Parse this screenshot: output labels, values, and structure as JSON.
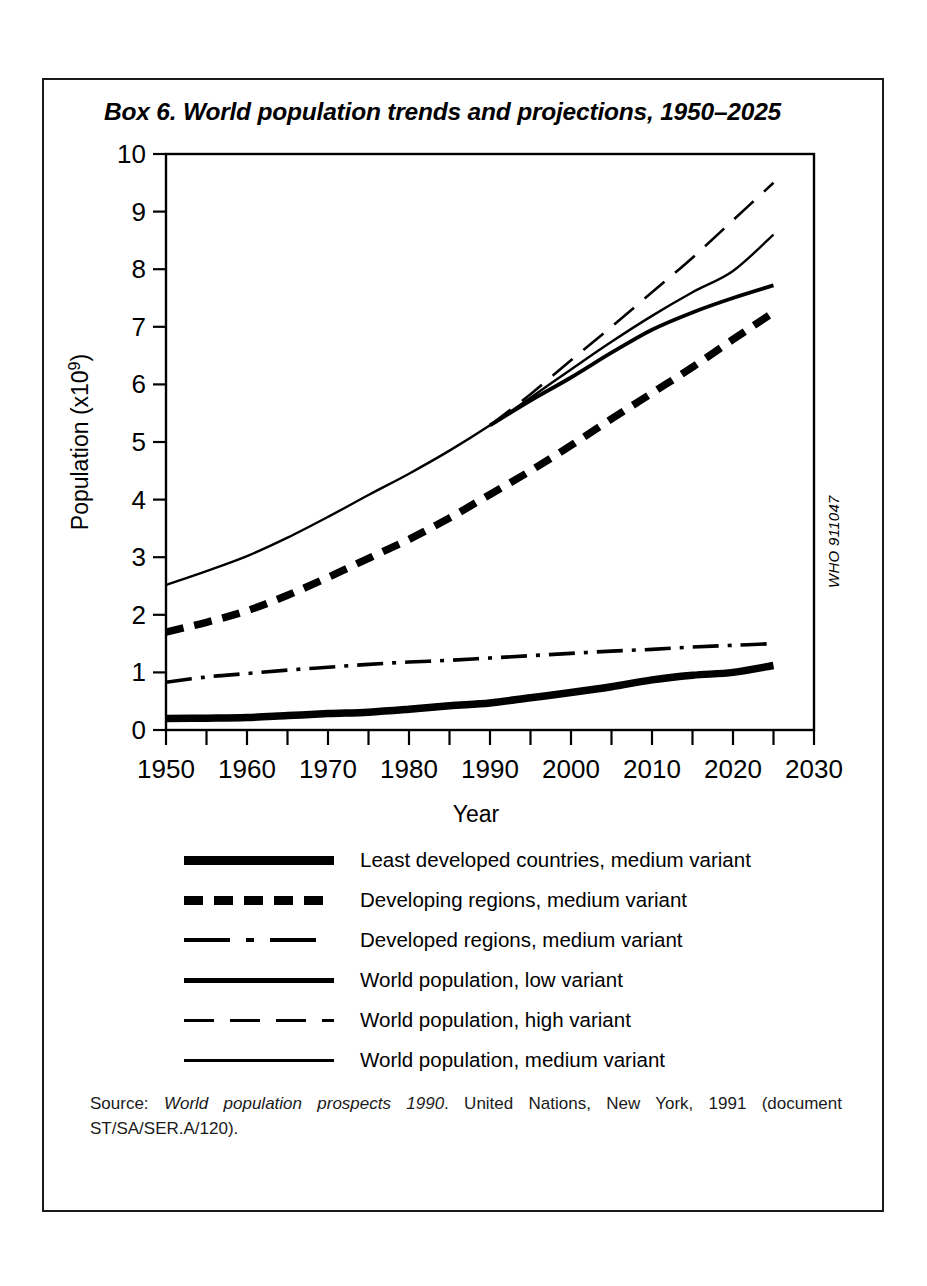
{
  "box": {
    "title": "Box 6. World population trends and projections, 1950–2025",
    "who_code": "WHO 911047"
  },
  "source": {
    "prefix": "Source: ",
    "italic_part": "World population prospects 1990",
    "rest": ". United Nations, New York, 1991 (document ST/SA/SER.A/120)."
  },
  "legend": {
    "items": [
      {
        "label": "Least developed countries, medium variant",
        "style": "solid-thick",
        "key": "least_developed"
      },
      {
        "label": "Developing regions, medium variant",
        "style": "dashed-thick",
        "key": "developing"
      },
      {
        "label": "Developed regions, medium variant",
        "style": "dash-dot",
        "key": "developed"
      },
      {
        "label": "World population, low variant",
        "style": "solid-medium",
        "key": "world_low"
      },
      {
        "label": "World population, high variant",
        "style": "long-dash",
        "key": "world_high"
      },
      {
        "label": "World population, medium variant",
        "style": "solid-thin",
        "key": "world_medium"
      }
    ]
  },
  "chart_data": {
    "type": "line",
    "title": "Box 6. World population trends and projections, 1950–2025",
    "xlabel": "Year",
    "ylabel": "Population (x10⁹)",
    "xlim": [
      1950,
      2030
    ],
    "ylim": [
      0,
      10
    ],
    "x_ticks": [
      1950,
      1960,
      1970,
      1980,
      1990,
      2000,
      2010,
      2020,
      2030
    ],
    "x_tick_labels": [
      "1950",
      "1960",
      "1970",
      "1980",
      "1990",
      "2000",
      "2010",
      "2020",
      "2030"
    ],
    "x_minor_ticks": [
      1955,
      1965,
      1975,
      1985,
      1995,
      2005,
      2015,
      2025
    ],
    "y_ticks": [
      0,
      1,
      2,
      3,
      4,
      5,
      6,
      7,
      8,
      9,
      10
    ],
    "y_tick_labels": [
      "0",
      "1",
      "2",
      "3",
      "4",
      "5",
      "6",
      "7",
      "8",
      "9",
      "10"
    ],
    "grid": false,
    "legend_position": "below",
    "series": [
      {
        "name": "World population, medium variant",
        "style": "solid-thin",
        "x": [
          1950,
          1955,
          1960,
          1965,
          1970,
          1975,
          1980,
          1985,
          1990,
          1995,
          2000,
          2005,
          2010,
          2015,
          2020,
          2025
        ],
        "values": [
          2.52,
          2.76,
          3.02,
          3.34,
          3.7,
          4.08,
          4.45,
          4.85,
          5.29,
          5.77,
          6.26,
          6.74,
          7.19,
          7.6,
          7.97,
          8.6
        ]
      },
      {
        "name": "World population, high variant",
        "style": "long-dash",
        "x": [
          1990,
          1995,
          2000,
          2005,
          2010,
          2015,
          2020,
          2025
        ],
        "values": [
          5.29,
          5.83,
          6.42,
          7.0,
          7.6,
          8.2,
          8.85,
          9.5
        ]
      },
      {
        "name": "World population, low variant",
        "style": "solid-medium",
        "x": [
          1990,
          1995,
          2000,
          2005,
          2010,
          2015,
          2020,
          2025
        ],
        "values": [
          5.29,
          5.72,
          6.12,
          6.55,
          6.95,
          7.25,
          7.5,
          7.72
        ]
      },
      {
        "name": "Developing regions, medium variant",
        "style": "dashed-thick",
        "x": [
          1950,
          1955,
          1960,
          1965,
          1970,
          1975,
          1980,
          1985,
          1990,
          1995,
          2000,
          2005,
          2010,
          2015,
          2020,
          2025
        ],
        "values": [
          1.7,
          1.87,
          2.07,
          2.34,
          2.65,
          2.98,
          3.31,
          3.68,
          4.09,
          4.5,
          4.94,
          5.4,
          5.85,
          6.3,
          6.78,
          7.25
        ]
      },
      {
        "name": "Developed regions, medium variant",
        "style": "dash-dot",
        "x": [
          1950,
          1955,
          1960,
          1965,
          1970,
          1975,
          1980,
          1985,
          1990,
          1995,
          2000,
          2005,
          2010,
          2015,
          2020,
          2025
        ],
        "values": [
          0.83,
          0.92,
          0.98,
          1.04,
          1.09,
          1.14,
          1.18,
          1.21,
          1.25,
          1.29,
          1.33,
          1.37,
          1.4,
          1.44,
          1.47,
          1.5
        ]
      },
      {
        "name": "Least developed countries, medium variant",
        "style": "solid-thick",
        "x": [
          1950,
          1955,
          1960,
          1965,
          1970,
          1975,
          1980,
          1985,
          1990,
          1995,
          2000,
          2005,
          2010,
          2015,
          2020,
          2025
        ],
        "values": [
          0.2,
          0.205,
          0.215,
          0.25,
          0.285,
          0.31,
          0.36,
          0.42,
          0.47,
          0.56,
          0.65,
          0.75,
          0.87,
          0.95,
          1.0,
          1.12
        ]
      }
    ]
  }
}
